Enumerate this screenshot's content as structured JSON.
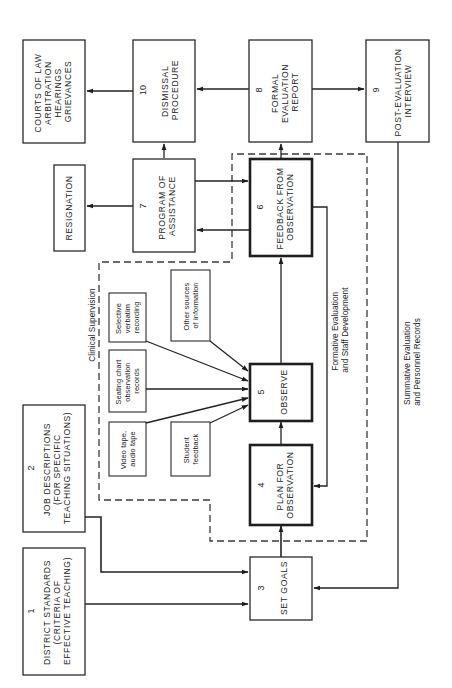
{
  "diagram": {
    "orientation": "rotated-90-ccw",
    "colors": {
      "ink": "#1c1c1c",
      "background": "#ffffff"
    },
    "boxes": [
      {
        "id": "1",
        "number": "1",
        "lines": [
          "DISTRICT STANDARDS",
          "(CRITERIA OF",
          "EFFECTIVE TEACHING)"
        ]
      },
      {
        "id": "2",
        "number": "2",
        "lines": [
          "JOB DESCRIPTIONS",
          "(FOR SPECIFIC",
          "TEACHING SITUATIONS)"
        ]
      },
      {
        "id": "3",
        "number": "3",
        "lines": [
          "SET GOALS"
        ]
      },
      {
        "id": "4",
        "number": "4",
        "lines": [
          "PLAN FOR",
          "OBSERVATION"
        ]
      },
      {
        "id": "5",
        "number": "5",
        "lines": [
          "OBSERVE"
        ]
      },
      {
        "id": "6",
        "number": "6",
        "lines": [
          "FEEDBACK FROM",
          "OBSERVATION"
        ]
      },
      {
        "id": "7",
        "number": "7",
        "lines": [
          "PROGRAM OF",
          "ASSISTANCE"
        ]
      },
      {
        "id": "8",
        "number": "8",
        "lines": [
          "FORMAL",
          "EVALUATION",
          "REPORT"
        ]
      },
      {
        "id": "9",
        "number": "9",
        "lines": [
          "POST-EVALUATION",
          "INTERVIEW"
        ]
      },
      {
        "id": "10",
        "number": "10",
        "lines": [
          "DISMISSAL",
          "PROCEDURE"
        ]
      },
      {
        "id": "courts",
        "lines": [
          "COURTS OF LAW",
          "ARBITRATION",
          "HEARINGS",
          "GRIEVANCES"
        ]
      },
      {
        "id": "resignation",
        "lines": [
          "RESIGNATION"
        ]
      }
    ],
    "observation_sources": [
      {
        "id": "video",
        "lines": [
          "Video tape,",
          "audio tape"
        ]
      },
      {
        "id": "student",
        "lines": [
          "Student",
          "feedback"
        ]
      },
      {
        "id": "seating",
        "lines": [
          "Seating chart",
          "observation",
          "records"
        ]
      },
      {
        "id": "verbatim",
        "lines": [
          "Selective",
          "verbatim",
          "recording"
        ]
      },
      {
        "id": "other",
        "lines": [
          "Other sources",
          "of information"
        ]
      }
    ],
    "region_label": "Clinical Supervision",
    "loop_labels": {
      "formative": [
        "Formative Evaluation",
        "and Staff Development"
      ],
      "summative": [
        "Summative Evaluation",
        "and Personnel Records"
      ]
    },
    "connections": [
      {
        "from": "1",
        "to": "3"
      },
      {
        "from": "2",
        "to": "3"
      },
      {
        "from": "3",
        "to": "4"
      },
      {
        "from": "4",
        "to": "5"
      },
      {
        "from": "video",
        "to": "5"
      },
      {
        "from": "student",
        "to": "5"
      },
      {
        "from": "seating",
        "to": "5"
      },
      {
        "from": "verbatim",
        "to": "5"
      },
      {
        "from": "other",
        "to": "5"
      },
      {
        "from": "5",
        "to": "6"
      },
      {
        "from": "6",
        "to": "4",
        "label": "formative"
      },
      {
        "from": "6",
        "to": "7"
      },
      {
        "from": "7",
        "to": "6"
      },
      {
        "from": "6",
        "to": "8"
      },
      {
        "from": "7",
        "to": "10"
      },
      {
        "from": "7",
        "to": "resignation"
      },
      {
        "from": "8",
        "to": "10"
      },
      {
        "from": "8",
        "to": "9"
      },
      {
        "from": "10",
        "to": "courts"
      },
      {
        "from": "9",
        "to": "3",
        "label": "summative"
      }
    ]
  }
}
